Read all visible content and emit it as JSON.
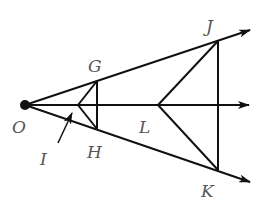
{
  "diagram": {
    "title": "",
    "points": {
      "O": {
        "label": "O",
        "x": 25,
        "y": 105
      },
      "G": {
        "label": "G",
        "x": 97,
        "y": 81
      },
      "H": {
        "label": "H",
        "x": 97,
        "y": 129
      },
      "I": {
        "label": "I",
        "x": 78,
        "y": 105
      },
      "L": {
        "label": "L",
        "x": 158,
        "y": 105
      },
      "J": {
        "label": "J",
        "x": 218,
        "y": 41
      },
      "K": {
        "label": "K",
        "x": 218,
        "y": 170
      }
    },
    "rays": [
      "O→upper (through G, J)",
      "O→middle",
      "O→lower (through H, K)"
    ],
    "segments": [
      "G-H",
      "G-I",
      "I-H",
      "J-K",
      "J-L",
      "L-K"
    ],
    "labels": {
      "O": "O",
      "G": "G",
      "H": "H",
      "I": "I",
      "L": "L",
      "J": "J",
      "K": "K"
    },
    "line_color": "#111111",
    "label_color": "#555555"
  }
}
